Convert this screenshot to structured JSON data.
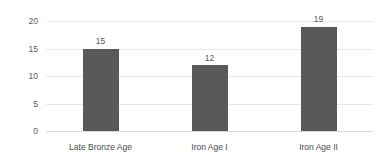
{
  "chart_data": {
    "type": "bar",
    "title": "",
    "subtitle": "",
    "xlabel": "",
    "ylabel": "",
    "categories": [
      "Late Bronze Age",
      "Iron Age I",
      "Iron Age II"
    ],
    "values": [
      15,
      12,
      19
    ],
    "data_labels": [
      "15",
      "12",
      "19"
    ],
    "ylim": [
      0,
      20
    ],
    "yticks": [
      0,
      5,
      10,
      15,
      20
    ],
    "ytick_labels": [
      "0",
      "5",
      "10",
      "15",
      "20"
    ],
    "grid": true,
    "legend": false,
    "legend_position": "none",
    "colors": {
      "bar_fill": "#595959",
      "gridline": "#e8e8e8",
      "baseline": "#d9d9d9",
      "tick_text": "#5a5a5a",
      "category_text": "#4a4a4a",
      "background": "#ffffff"
    }
  }
}
